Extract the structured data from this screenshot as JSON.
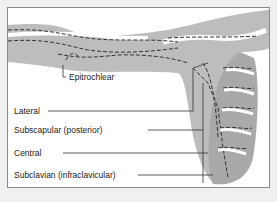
{
  "diagram": {
    "labels": [
      {
        "id": "epitrochlear",
        "text": "Epitrochlear"
      },
      {
        "id": "lateral",
        "text": "Lateral"
      },
      {
        "id": "subscapular",
        "text": "Subscapular (posterior)"
      },
      {
        "id": "central",
        "text": "Central"
      },
      {
        "id": "subclavian",
        "text": "Subclavian (infraclavicular)"
      }
    ]
  },
  "colors": {
    "skin": "#bdbdbd",
    "background": "#ffffff",
    "outer": "#f0f0f0",
    "line": "#333333"
  }
}
